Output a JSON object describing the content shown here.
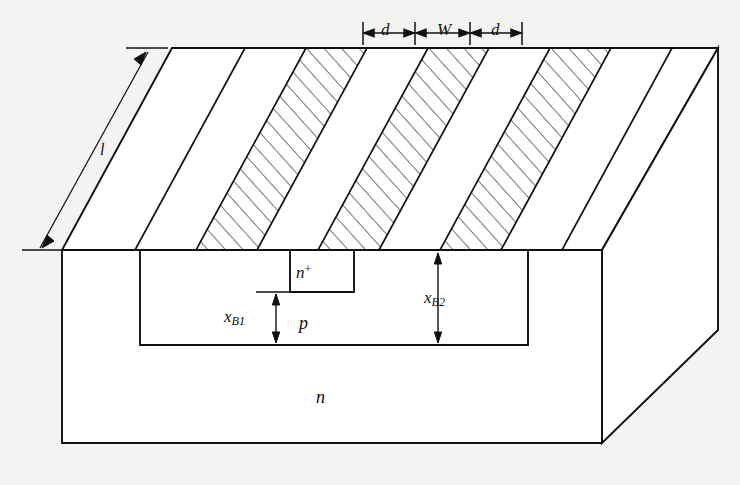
{
  "figure": {
    "background_color": "#f4f3f1",
    "line_color": "#111111"
  },
  "labels": {
    "d_left": "d",
    "w": "W",
    "d_right": "d",
    "length": "l",
    "n_plus_base": "n",
    "n_plus_sup": "+",
    "x_b1_base": "x",
    "x_b1_sub": "B1",
    "p_region": "p",
    "x_b2_base": "x",
    "x_b2_sub": "B2",
    "n_substrate": "n"
  },
  "dimensions": {
    "top_scale_ticks_x": [
      363,
      415,
      470,
      522
    ],
    "top_scale_y": 33,
    "segments": [
      {
        "name": "d-left",
        "from": 363,
        "to": 415,
        "label": "d"
      },
      {
        "name": "w-center",
        "from": 415,
        "to": 470,
        "label": "W"
      },
      {
        "name": "d-right",
        "from": 470,
        "to": 522,
        "label": "d"
      }
    ]
  },
  "geometry": {
    "front_face": {
      "left": 62,
      "right": 602,
      "top": 250,
      "bottom": 443
    },
    "p_region": {
      "left": 140,
      "right": 528,
      "top": 250,
      "bottom": 345
    },
    "n_plus_box": {
      "left": 290,
      "right": 354,
      "top": 250,
      "bottom": 292
    },
    "top_surface": {
      "front_left": [
        62,
        250
      ],
      "front_right": [
        602,
        250
      ],
      "back_right": [
        718,
        48
      ],
      "back_left": [
        172,
        48
      ]
    },
    "right_face": {
      "front_top": [
        602,
        250
      ],
      "back_top": [
        718,
        48
      ],
      "back_bottom": [
        718,
        330
      ],
      "front_bottom": [
        602,
        443
      ]
    }
  },
  "stripes": {
    "count": 9,
    "hatched_indices": [
      2,
      4,
      6
    ],
    "front_edge_x": [
      62,
      135,
      196,
      257,
      318,
      379,
      440,
      501,
      562,
      602
    ],
    "description": "Alternating hatched and clear diagonal stripes across the top surface"
  }
}
